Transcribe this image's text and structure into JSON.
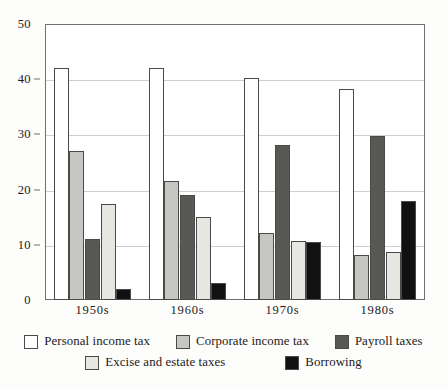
{
  "chart_data": {
    "type": "bar",
    "title": "",
    "subtitle": "",
    "xlabel": "",
    "ylabel": "",
    "ylim": [
      0,
      50
    ],
    "yticks": [
      0,
      10,
      20,
      30,
      40,
      50
    ],
    "ytick_labels": [
      "0",
      "10",
      "20",
      "30",
      "40",
      "50"
    ],
    "grid": true,
    "legend_position": "bottom",
    "categories": [
      "1950s",
      "1960s",
      "1970s",
      "1980s"
    ],
    "series": [
      {
        "name": "Personal income tax",
        "color": "#ffffff",
        "values": [
          42.0,
          42.0,
          40.3,
          38.3
        ]
      },
      {
        "name": "Corporate income tax",
        "color": "#c6c6c2",
        "values": [
          27.0,
          21.5,
          12.2,
          8.1
        ]
      },
      {
        "name": "Payroll taxes",
        "color": "#585855",
        "values": [
          11.1,
          19.0,
          28.1,
          29.7
        ]
      },
      {
        "name": "Excise and estate taxes",
        "color": "#e7e7e2",
        "values": [
          17.4,
          15.1,
          10.7,
          8.7
        ]
      },
      {
        "name": "Borrowing",
        "color": "#111111",
        "values": [
          2.0,
          3.0,
          10.5,
          18.0
        ]
      }
    ]
  },
  "legend": {
    "row1": [
      "Personal income tax",
      "Corporate income tax",
      "Payroll taxes"
    ],
    "row2": [
      "Excise and estate taxes",
      "Borrowing"
    ]
  }
}
